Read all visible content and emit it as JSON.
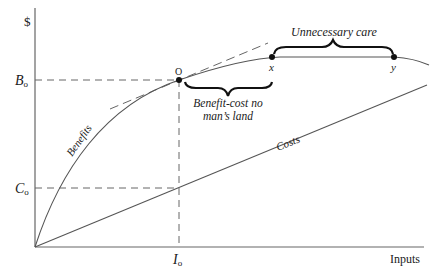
{
  "diagram": {
    "y_axis_label": "$",
    "x_axis_label": "Inputs",
    "curve_labels": {
      "benefits": "Benefits",
      "costs": "Costs"
    },
    "axis_markers": {
      "b_main": "B",
      "b_sub": "o",
      "c_main": "C",
      "c_sub": "o",
      "i_main": "I",
      "i_sub": "o"
    },
    "points": {
      "optimum": "O",
      "x": "x",
      "y": "y"
    },
    "annotations": {
      "no_mans_land_line1": "Benefit-cost no",
      "no_mans_land_line2": "man’s land",
      "unnecessary_care": "Unnecessary care"
    },
    "colors": {
      "line": "#555555",
      "text": "#1a1a1a",
      "background": "#ffffff"
    }
  }
}
